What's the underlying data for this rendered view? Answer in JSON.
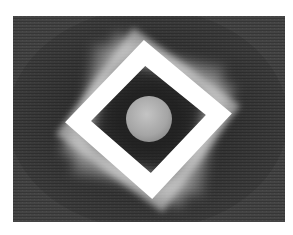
{
  "image": {
    "description": "Abstract grayscale artwork: rotated white square frame with motion-blur trails around a central gray sphere on a dark textured background",
    "colors": {
      "page_background": "#ffffff",
      "field_background": "#3f3f3f",
      "field_vignette": "#2a2a2a",
      "frame": "#ffffff",
      "ghost_frame": "#cfcfcf",
      "sphere_light": "#bdbdbd",
      "sphere_dark": "#8a8a8a"
    },
    "field": {
      "x": 13,
      "y": 16,
      "width": 272,
      "height": 206
    },
    "frame": {
      "cx": 148,
      "cy": 119,
      "half_diagonal": 82,
      "stroke": 18,
      "rotation_deg": 0
    },
    "sphere": {
      "cx": 149,
      "cy": 119,
      "r": 23
    }
  }
}
